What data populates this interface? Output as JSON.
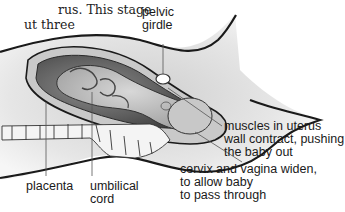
{
  "caption": {
    "line1": "rus. This stage",
    "line2": "ut three"
  },
  "labels": {
    "pelvic_girdle": [
      "pelvic",
      "girdle"
    ],
    "muscles": [
      "muscles in uterus",
      "wall contract, pushing",
      "the baby out"
    ],
    "cervix": [
      "cervix and vagina widen,",
      "to allow baby",
      "to pass through"
    ],
    "placenta": [
      "placenta"
    ],
    "umbilical_cord": [
      "umbilical",
      "cord"
    ]
  },
  "colors": {
    "outline": "#1a1a1a",
    "tissue_light": "#e4e4e4",
    "tissue_mid": "#bdbdbd",
    "tissue_dark": "#5a5a5a",
    "leader_line": "#555555"
  }
}
